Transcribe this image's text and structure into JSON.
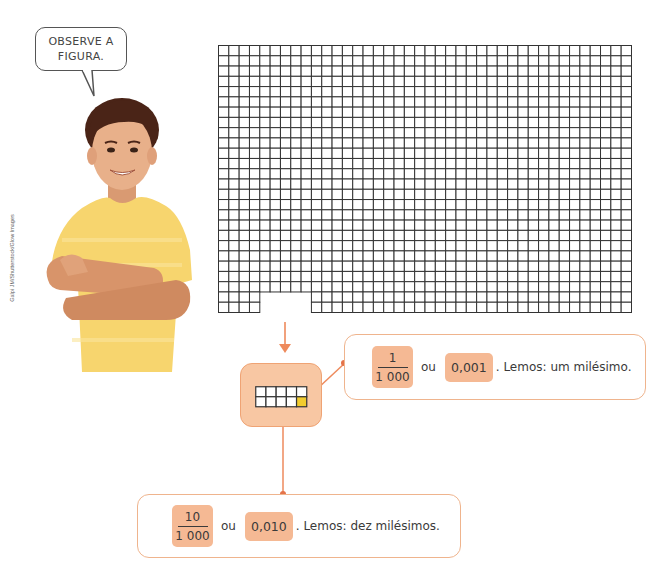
{
  "speech_bubble": {
    "line1": "OBSERVE A",
    "line2": "FIGURA."
  },
  "photo": {
    "subject": "boy in yellow t-shirt with crossed arms",
    "credit": "Galpi JM/Shutterstock/Glow Images"
  },
  "grid": {
    "columns": 40,
    "rows": 26,
    "notch": {
      "start_col": 4,
      "width_cols": 5,
      "height_rows": 2
    },
    "line_color": "#333333"
  },
  "mini_grid": {
    "columns": 5,
    "rows": 2,
    "highlighted_cell": "bottom-right",
    "highlight_color": "#f2cc2e"
  },
  "callouts": {
    "one_thousandth": {
      "numerator": "1",
      "denominator": "1 000",
      "connector": "ou",
      "decimal": "0,001",
      "reading": ". Lemos: um milésimo."
    },
    "ten_thousandths": {
      "numerator": "10",
      "denominator": "1 000",
      "connector": "ou",
      "decimal": "0,010",
      "reading": ". Lemos: dez milésimos."
    }
  },
  "colors": {
    "accent_orange": "#ee8a5c",
    "chip_fill": "#f5b994",
    "box_fill": "#f8c7a3",
    "callout_border": "#efb48d"
  }
}
